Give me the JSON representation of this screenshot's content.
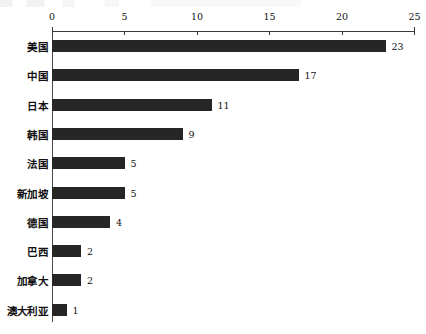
{
  "chart_data": {
    "type": "bar",
    "orientation": "horizontal",
    "title": "",
    "subtitle": "",
    "xlabel": "",
    "ylabel": "",
    "categories": [
      "美国",
      "中国",
      "日本",
      "韩国",
      "法国",
      "新加坡",
      "德国",
      "巴西",
      "加拿大",
      "澳大利亚"
    ],
    "values": [
      23,
      17,
      11,
      9,
      5,
      5,
      4,
      2,
      2,
      1
    ],
    "value_labels": [
      "23",
      "17",
      "11",
      "9",
      "5",
      "5",
      "4",
      "2",
      "2",
      "1"
    ],
    "xlim": [
      0,
      25
    ],
    "xticks": [
      0,
      5,
      10,
      15,
      20,
      25
    ],
    "xtick_labels": [
      "0",
      "5",
      "10",
      "15",
      "20",
      "25"
    ],
    "axis_position": "top",
    "grid": false,
    "legend": null,
    "bar_color": "#262626",
    "axis_color": "#3a3a3a",
    "background_color": "#ffffff"
  }
}
